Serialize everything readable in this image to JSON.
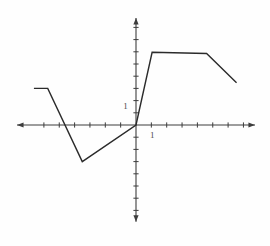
{
  "figure": {
    "background_color": "#fefefe"
  },
  "chart_data": {
    "type": "line",
    "title": "",
    "xlabel": "",
    "ylabel": "",
    "legend": null,
    "grid": false,
    "series": [
      {
        "name": "piecewise-linear-curve",
        "points": [
          [
            -6.65,
            1.5
          ],
          [
            -5.75,
            1.5
          ],
          [
            -3.5,
            -1.5
          ],
          [
            0,
            0
          ],
          [
            1.05,
            2.98
          ],
          [
            4.6,
            2.93
          ],
          [
            6.55,
            1.73
          ]
        ]
      }
    ],
    "axes": {
      "xlim": [
        -7.75,
        7.75
      ],
      "ylim": [
        -3.97,
        4.39
      ],
      "x_ticks": [
        -6,
        -5,
        -4,
        -3,
        -2,
        -1,
        1,
        2,
        3,
        4,
        5,
        6,
        7
      ],
      "y_ticks": [
        -3.5,
        -3,
        -2.5,
        -2,
        -1.5,
        -1,
        -0.5,
        0.5,
        1,
        1.5,
        2,
        2.5,
        3,
        3.5,
        4
      ],
      "x_tick_labels": [
        {
          "text": "1",
          "at": 1
        }
      ],
      "y_tick_labels": [
        {
          "text": "1",
          "at": 1
        }
      ],
      "arrows": true
    },
    "style": {
      "curve_color": "#2b2b2b",
      "axis_color": "#3d3d3d",
      "label_color": "#4a4a4a"
    },
    "pixel_mapping": {
      "origin": {
        "x": 136,
        "y": 125
      },
      "px_per_unit": {
        "x": 15.35,
        "y": 24.4
      },
      "canvas": {
        "width": 270,
        "height": 246
      }
    }
  }
}
